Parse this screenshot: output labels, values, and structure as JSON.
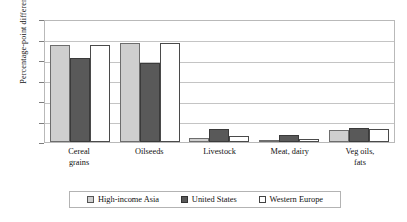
{
  "chart_data": {
    "type": "bar",
    "title": "",
    "xlabel": "",
    "ylabel": "Percentage-point difference",
    "ylim": [
      0,
      12
    ],
    "yticks": [
      "0",
      "2",
      "4",
      "6",
      "8",
      "10",
      "12"
    ],
    "grid": true,
    "legend_position": "bottom",
    "categories": [
      "Cereal grains",
      "Oilseeds",
      "Livestock",
      "Meat, dairy",
      "Veg oils, fats"
    ],
    "category_lines": [
      [
        "Cereal",
        "grains"
      ],
      [
        "Oilseeds",
        ""
      ],
      [
        "Livestock",
        ""
      ],
      [
        "Meat, dairy",
        ""
      ],
      [
        "Veg oils,",
        "fats"
      ]
    ],
    "series": [
      {
        "name": "High-income Asia",
        "color": "#cfcfcf",
        "values": [
          9.5,
          9.7,
          0.4,
          0.1,
          1.2
        ]
      },
      {
        "name": "United States",
        "color": "#595959",
        "values": [
          8.2,
          7.7,
          1.3,
          0.7,
          1.4
        ]
      },
      {
        "name": "Western Europe",
        "color": "#ffffff",
        "values": [
          9.5,
          9.7,
          0.6,
          0.3,
          1.3
        ]
      }
    ]
  },
  "legend": {
    "items": [
      {
        "label": "High-income Asia"
      },
      {
        "label": "United States"
      },
      {
        "label": "Western Europe"
      }
    ]
  }
}
